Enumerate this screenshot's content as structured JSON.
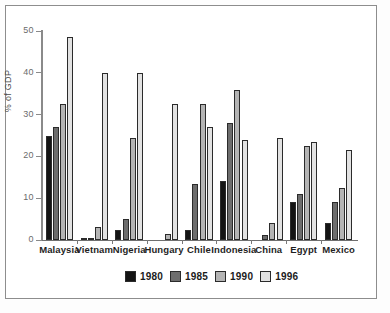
{
  "chart_data": {
    "type": "bar",
    "title": "",
    "xlabel": "",
    "ylabel": "% of GDP",
    "ylim": [
      0,
      50
    ],
    "yticks": [
      0,
      10,
      20,
      30,
      40,
      50
    ],
    "ytick_labels": [
      "0",
      "10",
      "20",
      "30",
      "40",
      "50"
    ],
    "grid": false,
    "legend_position": "bottom-center",
    "categories": [
      "Malaysia",
      "Vietnam",
      "Nigeria",
      "Hungary",
      "Chile",
      "Indonesia",
      "China",
      "Egypt",
      "Mexico"
    ],
    "series": [
      {
        "name": "1980",
        "color": "#141414",
        "values": [
          25.0,
          0.2,
          2.3,
          0.0,
          2.5,
          14.0,
          0.0,
          9.0,
          4.0
        ]
      },
      {
        "name": "1985",
        "color": "#6d6d6d",
        "values": [
          27.0,
          0.4,
          5.0,
          0.0,
          13.5,
          28.0,
          1.2,
          11.0,
          9.0
        ]
      },
      {
        "name": "1990",
        "color": "#b4b4b4",
        "values": [
          32.5,
          3.0,
          24.5,
          1.5,
          32.5,
          36.0,
          4.0,
          22.5,
          12.5
        ]
      },
      {
        "name": "1996",
        "color": "#e2e2e2",
        "values": [
          48.5,
          40.0,
          40.0,
          32.5,
          27.0,
          24.0,
          24.5,
          23.5,
          21.5
        ]
      }
    ]
  },
  "legend": {
    "items": [
      {
        "label": "1980"
      },
      {
        "label": "1985"
      },
      {
        "label": "1990"
      },
      {
        "label": "1996"
      }
    ]
  }
}
